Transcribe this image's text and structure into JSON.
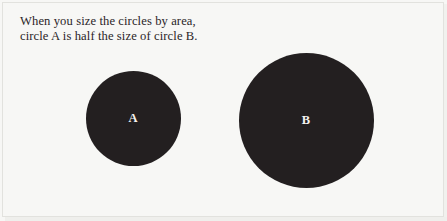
{
  "figure": {
    "background_color": "#f7f7f5",
    "border_color": "#e2e2de",
    "caption": {
      "line1": "When you size the circles by area,",
      "line2": "circle A is half the size of circle B."
    }
  },
  "chart_data": {
    "type": "scatter",
    "title": "When you size the circles by area, circle A is half the size of circle B.",
    "subtitle": "",
    "xlabel": "",
    "ylabel": "",
    "grid": false,
    "legend": "none",
    "encoding": "area",
    "area_ratio_a_to_b": "1:2",
    "fill_color": "#231f20",
    "label_color": "#f4f2ef",
    "categories": [
      "A",
      "B"
    ],
    "values": [
      1,
      2
    ],
    "circles": [
      {
        "label": "A",
        "relative_area": 1,
        "diameter_px": 95,
        "center_x_px": 133,
        "center_y_px": 118,
        "color": "#231f20"
      },
      {
        "label": "B",
        "relative_area": 2,
        "diameter_px": 135,
        "center_x_px": 306,
        "center_y_px": 120,
        "color": "#231f20"
      }
    ]
  }
}
